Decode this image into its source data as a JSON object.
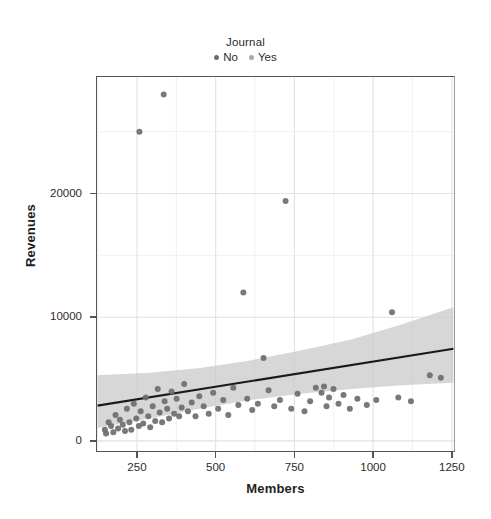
{
  "legend": {
    "title": "Journal",
    "items": [
      {
        "label": "No",
        "color": "#6e6e6e"
      },
      {
        "label": "Yes",
        "color": "#a8a8a8"
      }
    ]
  },
  "chart_data": {
    "type": "scatter",
    "title": "",
    "xlabel": "Members",
    "ylabel": "Revenues",
    "xlim": [
      120,
      1260
    ],
    "ylim": [
      -900,
      29500
    ],
    "xticks": [
      250,
      500,
      750,
      1000,
      1250
    ],
    "xtick_labels": [
      "250",
      "500",
      "750",
      "1000",
      "1250"
    ],
    "yticks": [
      0,
      10000,
      20000
    ],
    "ytick_labels": [
      "0",
      "10000",
      "20000"
    ],
    "grid": true,
    "legend_position": "top-center",
    "point_color": "#6e6e6e",
    "line_color": "#1a1a1a",
    "band_color": "#c8c8c8",
    "series": [
      {
        "name": "No",
        "color": "#6e6e6e",
        "points": [
          [
            148,
            900
          ],
          [
            152,
            600
          ],
          [
            160,
            1500
          ],
          [
            168,
            1200
          ],
          [
            175,
            700
          ],
          [
            182,
            2100
          ],
          [
            190,
            1000
          ],
          [
            196,
            1700
          ],
          [
            205,
            1300
          ],
          [
            212,
            800
          ],
          [
            218,
            2600
          ],
          [
            226,
            1500
          ],
          [
            232,
            900
          ],
          [
            240,
            3000
          ],
          [
            248,
            1800
          ],
          [
            256,
            1200
          ],
          [
            262,
            2400
          ],
          [
            270,
            1400
          ],
          [
            278,
            3500
          ],
          [
            286,
            2000
          ],
          [
            292,
            1100
          ],
          [
            300,
            2800
          ],
          [
            308,
            1600
          ],
          [
            316,
            4200
          ],
          [
            322,
            2300
          ],
          [
            330,
            1500
          ],
          [
            338,
            3200
          ],
          [
            346,
            2600
          ],
          [
            352,
            1800
          ],
          [
            360,
            4000
          ],
          [
            368,
            2200
          ],
          [
            376,
            3400
          ],
          [
            384,
            2000
          ],
          [
            392,
            2700
          ],
          [
            400,
            4600
          ],
          [
            412,
            2400
          ],
          [
            424,
            3100
          ],
          [
            436,
            2000
          ],
          [
            448,
            3600
          ],
          [
            462,
            2800
          ],
          [
            478,
            2200
          ],
          [
            492,
            3900
          ],
          [
            508,
            2600
          ],
          [
            524,
            3300
          ],
          [
            540,
            2100
          ],
          [
            556,
            4300
          ],
          [
            572,
            2900
          ],
          [
            588,
            12000
          ],
          [
            600,
            3400
          ],
          [
            616,
            2500
          ],
          [
            634,
            3000
          ],
          [
            652,
            6700
          ],
          [
            668,
            4100
          ],
          [
            686,
            2800
          ],
          [
            704,
            3300
          ],
          [
            722,
            19400
          ],
          [
            740,
            2600
          ],
          [
            760,
            3800
          ],
          [
            782,
            2400
          ],
          [
            800,
            3200
          ],
          [
            818,
            4300
          ],
          [
            836,
            3900
          ],
          [
            844,
            4400
          ],
          [
            852,
            2800
          ],
          [
            860,
            3500
          ],
          [
            874,
            4200
          ],
          [
            890,
            3000
          ],
          [
            906,
            3700
          ],
          [
            926,
            2600
          ],
          [
            950,
            3400
          ],
          [
            980,
            2900
          ],
          [
            1010,
            3300
          ],
          [
            1060,
            10400
          ],
          [
            1080,
            3500
          ],
          [
            1120,
            3200
          ],
          [
            1180,
            5300
          ],
          [
            1215,
            5100
          ],
          [
            335,
            28000
          ],
          [
            258,
            25000
          ]
        ]
      },
      {
        "name": "Yes",
        "color": "#a8a8a8",
        "points": []
      }
    ],
    "fit": {
      "label": "linear-fit",
      "x": [
        125,
        1255
      ],
      "y": [
        2850,
        7450
      ],
      "band_upper": [
        5300,
        5500,
        5900,
        6500,
        7300,
        8200,
        9400,
        10800
      ],
      "band_lower": [
        1050,
        1800,
        2600,
        3300,
        3800,
        4200,
        4500,
        4700
      ],
      "band_x": [
        125,
        290,
        450,
        610,
        770,
        930,
        1090,
        1255
      ]
    }
  }
}
